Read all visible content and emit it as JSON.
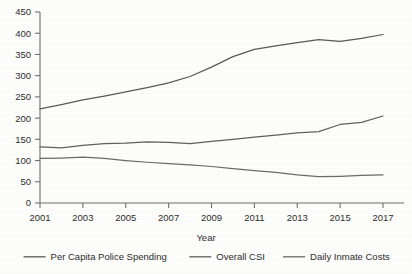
{
  "chart_data": {
    "type": "line",
    "title": "",
    "xlabel": "Year",
    "ylabel": "",
    "x": [
      2001,
      2002,
      2003,
      2004,
      2005,
      2006,
      2007,
      2008,
      2009,
      2010,
      2011,
      2012,
      2013,
      2014,
      2015,
      2016,
      2017
    ],
    "xlim": [
      2001,
      2017
    ],
    "ylim": [
      0,
      450
    ],
    "xtick_labels": [
      "2001",
      "2003",
      "2005",
      "2007",
      "2009",
      "2011",
      "2013",
      "2015",
      "2017"
    ],
    "xtick_values": [
      2001,
      2003,
      2005,
      2007,
      2009,
      2011,
      2013,
      2015,
      2017
    ],
    "ytick_labels": [
      "0",
      "50",
      "100",
      "150",
      "200",
      "250",
      "300",
      "350",
      "400",
      "450"
    ],
    "ytick_values": [
      0,
      50,
      100,
      150,
      200,
      250,
      300,
      350,
      400,
      450
    ],
    "grid": false,
    "legend_position": "bottom",
    "series": [
      {
        "name": "Per Capita Police Spending",
        "color": "#595959",
        "values": [
          222,
          232,
          243,
          252,
          262,
          272,
          283,
          298,
          320,
          345,
          362,
          370,
          378,
          385,
          381,
          388,
          397
        ]
      },
      {
        "name": "Overall CSI",
        "color": "#5f5f5f",
        "values": [
          132,
          130,
          136,
          140,
          141,
          144,
          143,
          140,
          145,
          150,
          155,
          160,
          165,
          168,
          185,
          190,
          205
        ]
      },
      {
        "name": "Daily Inmate Costs",
        "color": "#6a6a6a",
        "values": [
          105,
          106,
          108,
          105,
          100,
          96,
          93,
          90,
          86,
          81,
          76,
          72,
          66,
          62,
          63,
          65,
          66
        ]
      }
    ]
  },
  "legend": {
    "items": [
      {
        "label": "Per Capita Police Spending"
      },
      {
        "label": "Overall CSI"
      },
      {
        "label": "Daily Inmate Costs"
      }
    ]
  },
  "axes": {
    "x_axis_title": "Year"
  }
}
